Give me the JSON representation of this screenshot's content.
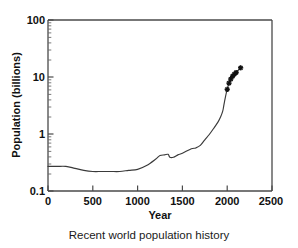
{
  "caption": "Recent world population history",
  "chart_data": {
    "type": "line",
    "title": "",
    "xlabel": "Year",
    "ylabel": "Population (billions)",
    "xlim": [
      0,
      2500
    ],
    "ylim": [
      0.1,
      100
    ],
    "yscale": "log",
    "xscale": "linear",
    "grid": false,
    "legend": null,
    "xticks": [
      0,
      500,
      1000,
      1500,
      2000,
      2500
    ],
    "xtick_labels": [
      "0",
      "500",
      "1000",
      "1500",
      "2000",
      "2500"
    ],
    "yticks": [
      0.1,
      1,
      10,
      100
    ],
    "ytick_labels": [
      "0.1",
      "1",
      "10",
      "100"
    ],
    "y_minor_ticks": true,
    "series": [
      {
        "name": "World population",
        "style": "solid-line",
        "x": [
          0,
          100,
          200,
          300,
          400,
          500,
          600,
          700,
          800,
          900,
          1000,
          1100,
          1200,
          1250,
          1300,
          1340,
          1360,
          1400,
          1450,
          1500,
          1600,
          1650,
          1700,
          1750,
          1800,
          1850,
          1900,
          1927,
          1950,
          1960,
          1970,
          1980,
          1990,
          2000
        ],
        "y": [
          0.27,
          0.27,
          0.27,
          0.25,
          0.23,
          0.22,
          0.22,
          0.22,
          0.22,
          0.23,
          0.24,
          0.28,
          0.36,
          0.42,
          0.43,
          0.44,
          0.39,
          0.39,
          0.43,
          0.46,
          0.55,
          0.57,
          0.63,
          0.79,
          0.98,
          1.26,
          1.65,
          2.0,
          2.52,
          3.02,
          3.7,
          4.44,
          5.27,
          6.07
        ]
      },
      {
        "name": "Projection",
        "style": "line-with-cross-markers",
        "x": [
          2000,
          2020,
          2040,
          2060,
          2080,
          2100,
          2150
        ],
        "y": [
          6.07,
          7.8,
          9.2,
          10.3,
          11.2,
          12.0,
          14.5
        ]
      }
    ],
    "markers": {
      "symbol": "cross-star",
      "color": "#111111",
      "count": 7
    },
    "annotations": []
  }
}
